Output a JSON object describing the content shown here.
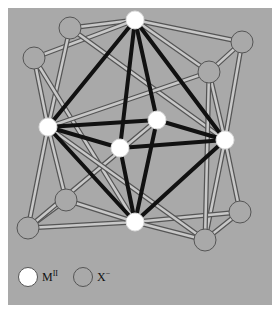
{
  "diagram": {
    "title": "",
    "colors": {
      "background": "#a9a9a9",
      "cation_fill": "#ffffff",
      "anion_fill": "#a9a9a9",
      "anion_stroke": "#555555",
      "metal_bond": "#111111"
    },
    "legend": [
      {
        "symbol": "white-circle",
        "label": "M",
        "sup": "II"
      },
      {
        "symbol": "gray-circle",
        "label": "X",
        "sup": "−"
      }
    ]
  }
}
